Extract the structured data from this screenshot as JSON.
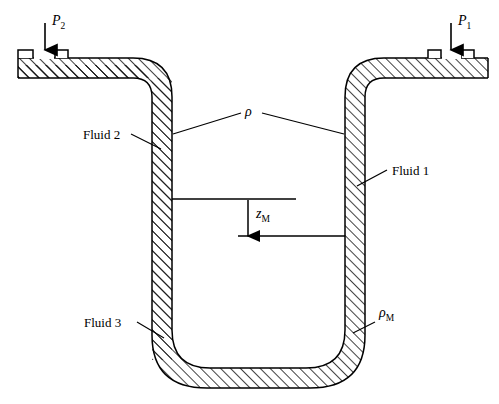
{
  "figure": {
    "type": "manometer-diagram",
    "colors": {
      "line": "#000000",
      "hatch": "#1a1a1a",
      "background": "#ffffff"
    }
  },
  "labels": {
    "pressure_left": {
      "symbol": "P",
      "subscript": "2",
      "text": "P2"
    },
    "pressure_right": {
      "symbol": "P",
      "subscript": "1",
      "text": "P1"
    },
    "fluid_left": "Fluid 2",
    "fluid_right": "Fluid 1",
    "fluid_bottom": "Fluid 3",
    "density": {
      "symbol": "ρ",
      "subscript": "",
      "text": "ρ"
    },
    "density_manometer": {
      "symbol": "ρ",
      "subscript": "M",
      "text": "ρM"
    },
    "height": {
      "symbol": "z",
      "subscript": "M",
      "text": "zM"
    }
  },
  "annotations": {
    "arrow_left_label": "P2 inlet arrow",
    "arrow_right_label": "P1 inlet arrow",
    "height_arrow_label": "zM dimension arrow"
  }
}
